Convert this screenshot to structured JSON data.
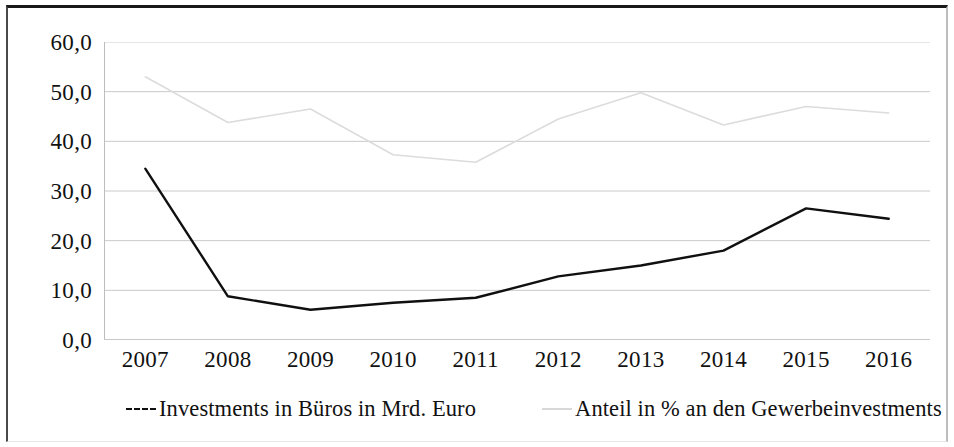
{
  "chart_data": {
    "type": "line",
    "title": "",
    "subtitle": "",
    "xlabel": "",
    "ylabel": "",
    "categories": [
      "2007",
      "2008",
      "2009",
      "2010",
      "2011",
      "2012",
      "2013",
      "2014",
      "2015",
      "2016"
    ],
    "ylim": [
      0,
      60
    ],
    "ytick_step": 10,
    "ytick_labels": [
      "60,0",
      "50,0",
      "40,0",
      "30,0",
      "20,0",
      "10,0",
      "0,0"
    ],
    "ytick_values": [
      60,
      50,
      40,
      30,
      20,
      10,
      0
    ],
    "grid": true,
    "grid_axis": "y",
    "legend_position": "bottom",
    "series": [
      {
        "name": "Investments in Büros in Mrd. Euro",
        "color": "#101010",
        "style": "solid-dark",
        "values": [
          34.5,
          8.8,
          6.1,
          7.5,
          8.5,
          12.8,
          15.0,
          18.0,
          26.5,
          24.4
        ]
      },
      {
        "name": "Anteil in % an den Gewerbeinvestments",
        "color": "#dcdcdc",
        "style": "light-grey",
        "values": [
          53.0,
          43.8,
          46.5,
          37.3,
          35.8,
          44.5,
          49.8,
          43.3,
          47.0,
          45.7
        ]
      }
    ]
  },
  "legend": {
    "entries": [
      {
        "label": "Investments in Büros in Mrd. Euro",
        "swatch": "dashed-black-line"
      },
      {
        "label": "Anteil in % an den Gewerbeinvestments",
        "swatch": "solid-grey-line"
      }
    ]
  },
  "axes": {
    "y": {
      "labels": [
        "60,0",
        "50,0",
        "40,0",
        "30,0",
        "20,0",
        "10,0",
        "0,0"
      ]
    },
    "x": {
      "labels": [
        "2007",
        "2008",
        "2009",
        "2010",
        "2011",
        "2012",
        "2013",
        "2014",
        "2015",
        "2016"
      ]
    }
  },
  "colors": {
    "series_primary": "#101010",
    "series_secondary": "#dcdcdc",
    "gridline": "#c9c9c9",
    "axis": "#bdbdbd",
    "frame": "#1a1a1a",
    "text": "#111111"
  }
}
